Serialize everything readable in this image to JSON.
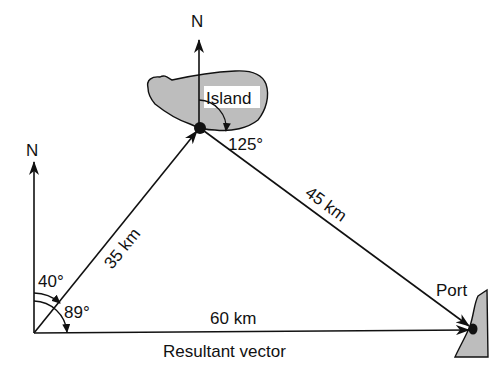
{
  "diagram": {
    "title": "",
    "points": {
      "origin": {
        "x": 33,
        "y": 333
      },
      "island": {
        "x": 200,
        "y": 128
      },
      "port": {
        "x": 473,
        "y": 330
      }
    },
    "labels": {
      "north_top": "N",
      "north_left": "N",
      "island": "Island",
      "port": "Port",
      "angle_island": "125°",
      "angle_40": "40°",
      "angle_89": "89°",
      "leg1": "35 km",
      "leg2": "45 km",
      "resultant_distance": "60 km",
      "resultant_caption": "Resultant vector"
    },
    "vectors": [
      {
        "from": "origin",
        "to": "island",
        "label": "35 km",
        "bearing_deg": 40
      },
      {
        "from": "island",
        "to": "port",
        "label": "45 km",
        "bearing_deg": 125
      },
      {
        "from": "origin",
        "to": "port",
        "label": "60 km",
        "bearing_deg": 89,
        "type": "resultant"
      }
    ],
    "colors": {
      "line": "#111111",
      "land_fill": "#bdbdbd",
      "background": "#ffffff"
    }
  }
}
